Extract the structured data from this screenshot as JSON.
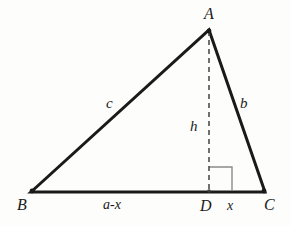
{
  "figure": {
    "kind": "geometry-diagram",
    "background_color": "#fdfdfc",
    "stroke_color": "#1a1a1a",
    "dashed_color": "#666666",
    "right_angle_color": "#8a8a8a"
  },
  "vertices": {
    "A": {
      "label": "A",
      "x": 209,
      "y": 30
    },
    "B": {
      "label": "B",
      "x": 31,
      "y": 192
    },
    "C": {
      "label": "C",
      "x": 265,
      "y": 192
    },
    "D": {
      "label": "D",
      "x": 209,
      "y": 192
    }
  },
  "sides": {
    "c": {
      "label": "c",
      "from": "B",
      "to": "A"
    },
    "b": {
      "label": "b",
      "from": "A",
      "to": "C"
    },
    "base": {
      "from": "B",
      "to": "C"
    }
  },
  "altitude": {
    "label": "h",
    "from": "A",
    "to": "D",
    "style": "dashed"
  },
  "base_segments": {
    "left": {
      "label": "a-x",
      "from": "B",
      "to": "D"
    },
    "right": {
      "label": "x",
      "from": "D",
      "to": "C"
    }
  },
  "right_angle_marker": {
    "name": "right-angle-at-D",
    "x": 209,
    "y": 167,
    "size": 24
  },
  "geometry_paths": {
    "triangle": "M 31 192 L 209 30 L 265 192 Z",
    "altitude": "M 209 31 L 209 192",
    "right_angle": "M 209 167 L 232 167 L 232 191"
  }
}
